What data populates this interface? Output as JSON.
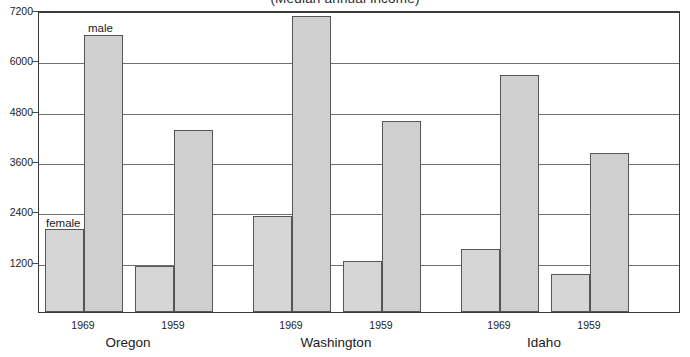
{
  "chart_data": {
    "type": "bar",
    "title": "(Median annual income)",
    "xlabel": "",
    "ylabel": "",
    "ylim": [
      0,
      7200
    ],
    "yticks": [
      1200,
      2400,
      3600,
      4800,
      6000,
      7200
    ],
    "ytick_labels": [
      "1200",
      "2400",
      "3600",
      "4800",
      "6000",
      "7200"
    ],
    "grid": true,
    "legend_position": "inline-annotation",
    "categories": [
      "Oregon 1969",
      "Oregon 1959",
      "Washington 1969",
      "Washington 1959",
      "Idaho 1969",
      "Idaho 1959"
    ],
    "groups": [
      {
        "name": "Oregon",
        "years": [
          {
            "year": "1969",
            "female": 1990,
            "male": 6600
          },
          {
            "year": "1959",
            "female": 1090,
            "male": 4350
          }
        ]
      },
      {
        "name": "Washington",
        "years": [
          {
            "year": "1969",
            "female": 2280,
            "male": 7050
          },
          {
            "year": "1959",
            "female": 1220,
            "male": 4550
          }
        ]
      },
      {
        "name": "Idaho",
        "years": [
          {
            "year": "1969",
            "female": 1500,
            "male": 5650
          },
          {
            "year": "1959",
            "female": 900,
            "male": 3780
          }
        ]
      }
    ],
    "series": [
      {
        "name": "female",
        "values": [
          1990,
          1090,
          2280,
          1220,
          1500,
          900
        ]
      },
      {
        "name": "male",
        "values": [
          6600,
          4350,
          7050,
          4550,
          5650,
          3780
        ]
      }
    ],
    "annotations": [
      {
        "text": "female",
        "refers_to": "Oregon 1969 female bar"
      },
      {
        "text": "male",
        "refers_to": "Oregon 1969 male bar"
      }
    ],
    "colors": {
      "bar_fill": "#d6d6d6",
      "bar_border": "#565656",
      "gridline": "#6f6f6f",
      "axis": "#3a3a3a",
      "text": "#1a1a1a"
    }
  }
}
